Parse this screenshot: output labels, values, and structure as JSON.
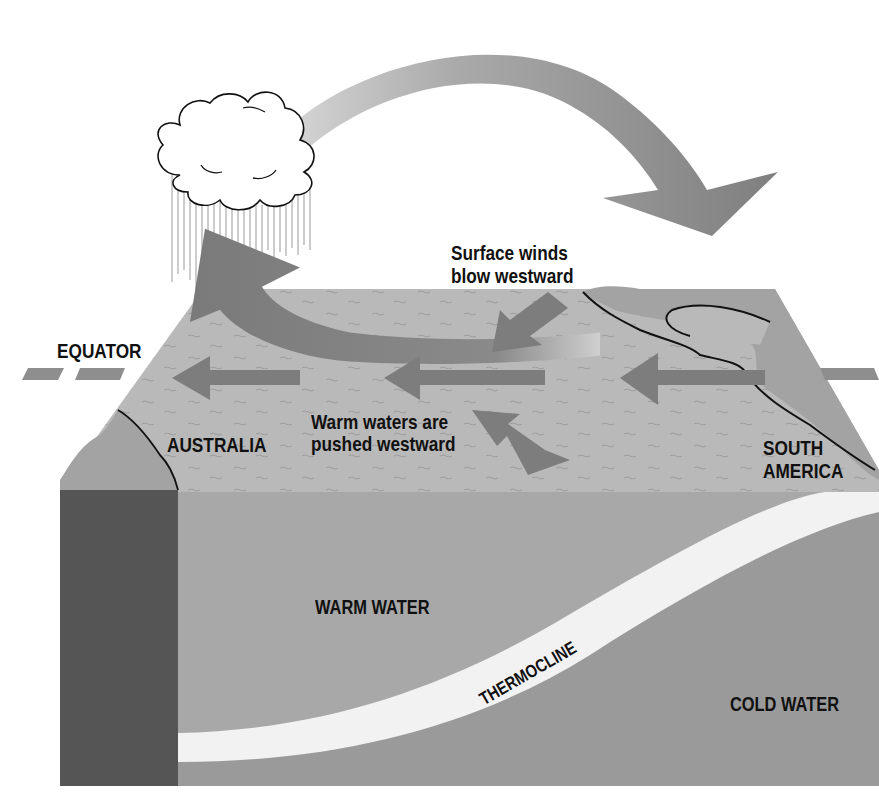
{
  "diagram": {
    "title_hidden": "Normal (non–El Niño) Pacific Ocean conditions",
    "labels": {
      "equator": "EQUATOR",
      "surface_winds_line1": "Surface winds",
      "surface_winds_line2": "blow westward",
      "warm_waters_line1": "Warm waters are",
      "warm_waters_line2": "pushed westward",
      "australia": "AUSTRALIA",
      "south_america_line1": "SOUTH",
      "south_america_line2": "AMERICA",
      "warm_water": "WARM WATER",
      "thermocline": "THERMOCLINE",
      "cold_water": "COLD WATER"
    },
    "elements": {
      "cloud": "rain-cloud-icon",
      "circulation_arrow": "walker-circulation-arrow",
      "surface_arrows": [
        "westward-arrow",
        "westward-arrow",
        "westward-arrow",
        "converging-arrow",
        "converging-arrow",
        "rising-curved-arrow"
      ]
    },
    "colors": {
      "background": "#ffffff",
      "ocean_surface": "#b9b9b9",
      "land": "#a3a3a3",
      "arrow": "#7d7d7d",
      "warm_water": "#a8a8a8",
      "cold_water": "#9a9a9a",
      "thermocline": "#f2f2f2",
      "front_land": "#555555",
      "text": "#111111"
    }
  }
}
